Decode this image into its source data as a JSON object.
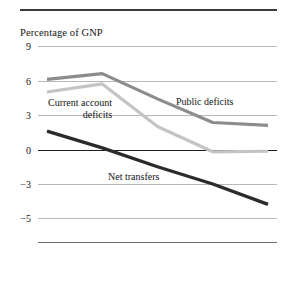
{
  "figure": {
    "title": "Percentage of GNP"
  },
  "chart_data": {
    "type": "line",
    "title": "Percentage of GNP",
    "xlabel": "",
    "ylabel": "Percentage of GNP",
    "x": [
      "1981",
      "1982",
      "1983",
      "1984",
      "1985"
    ],
    "ytick_labels": [
      "9",
      "6",
      "3",
      "0",
      "−3",
      "−5"
    ],
    "ytick_values": [
      9,
      6,
      3,
      0,
      -3,
      -5
    ],
    "ylim": [
      -5,
      9
    ],
    "grid": true,
    "legend": "inline-labels",
    "series": [
      {
        "name": "Public deficits",
        "color": "#8c8c8c",
        "values": [
          6.1,
          6.6,
          4.4,
          2.35,
          2.1
        ]
      },
      {
        "name": "Current account deficits",
        "color": "#c4c4c4",
        "values": [
          5.0,
          5.7,
          2.0,
          -0.2,
          -0.15
        ]
      },
      {
        "name": "Net transfers",
        "color": "#2b2b2b",
        "values": [
          1.6,
          0.15,
          -1.5,
          -3.0,
          -4.2
        ]
      }
    ]
  },
  "labels": {
    "public_deficits": "Public deficits",
    "current_account_line1": "Current account",
    "current_account_line2": "deficits",
    "net_transfers": "Net transfers"
  }
}
